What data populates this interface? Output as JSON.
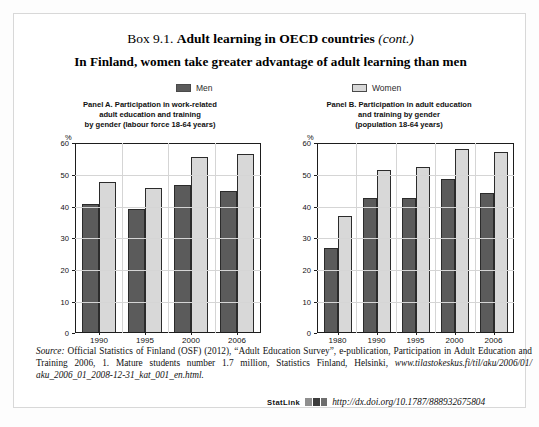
{
  "box": {
    "number": "Box 9.1.",
    "title": "Adult learning in OECD countries",
    "continued": "(cont.)",
    "subtitle": "In Finland, women take greater advantage of adult learning than men"
  },
  "legend": {
    "men_label": "Men",
    "women_label": "Women",
    "men_color": "#5b5b5b",
    "women_color": "#d8d8d8"
  },
  "panel_a": {
    "title_line1": "Panel A. Participation in work-related",
    "title_line2": "adult education and training",
    "title_line3": "by gender (labour force 18-64 years)",
    "unit": "%"
  },
  "panel_b": {
    "title_line1": "Panel B. Participation in adult education",
    "title_line2": "and training by gender",
    "title_line3": "(population 18-64 years)",
    "unit": "%"
  },
  "source": {
    "lead": "Source:",
    "text": " Official Statistics of Finland (OSF) (2012), “Adult Education Survey”, e-publication, Participation in Adult Education and Training 2006, 1. Mature students number 1.7 million, Statistics Finland, Helsinki, ",
    "url": "www.tilastokeskus.fi/til/aku/2006/01/ aku_2006_01_2008-12-31_kat_001_en.html."
  },
  "statlink": {
    "label": "StatLink",
    "icon": "statlink-barcode-icon",
    "url": "http://dx.doi.org/10.1787/888932675804"
  },
  "chart_data": [
    {
      "type": "bar",
      "title": "Panel A. Participation in work-related adult education and training by gender (labour force 18-64 years)",
      "xlabel": "",
      "ylabel": "%",
      "ylim": [
        0,
        60
      ],
      "yticks": [
        0,
        10,
        20,
        30,
        40,
        50,
        60
      ],
      "grid": true,
      "legend_position": "top",
      "categories": [
        "1990",
        "1995",
        "2000",
        "2006"
      ],
      "series": [
        {
          "name": "Men",
          "color": "#5b5b5b",
          "values": [
            41,
            39.5,
            47,
            45
          ]
        },
        {
          "name": "Women",
          "color": "#d8d8d8",
          "values": [
            48,
            46,
            56,
            57
          ]
        }
      ]
    },
    {
      "type": "bar",
      "title": "Panel B. Participation in adult education and training by gender (population 18-64 years)",
      "xlabel": "",
      "ylabel": "%",
      "ylim": [
        0,
        60
      ],
      "yticks": [
        0,
        10,
        20,
        30,
        40,
        50,
        60
      ],
      "grid": true,
      "legend_position": "top",
      "categories": [
        "1980",
        "1990",
        "1995",
        "2000",
        "2006"
      ],
      "series": [
        {
          "name": "Men",
          "color": "#5b5b5b",
          "values": [
            27,
            43,
            42.8,
            48.8,
            44.5
          ]
        },
        {
          "name": "Women",
          "color": "#d8d8d8",
          "values": [
            37,
            51.8,
            52.7,
            58.5,
            57.5
          ]
        }
      ]
    }
  ]
}
